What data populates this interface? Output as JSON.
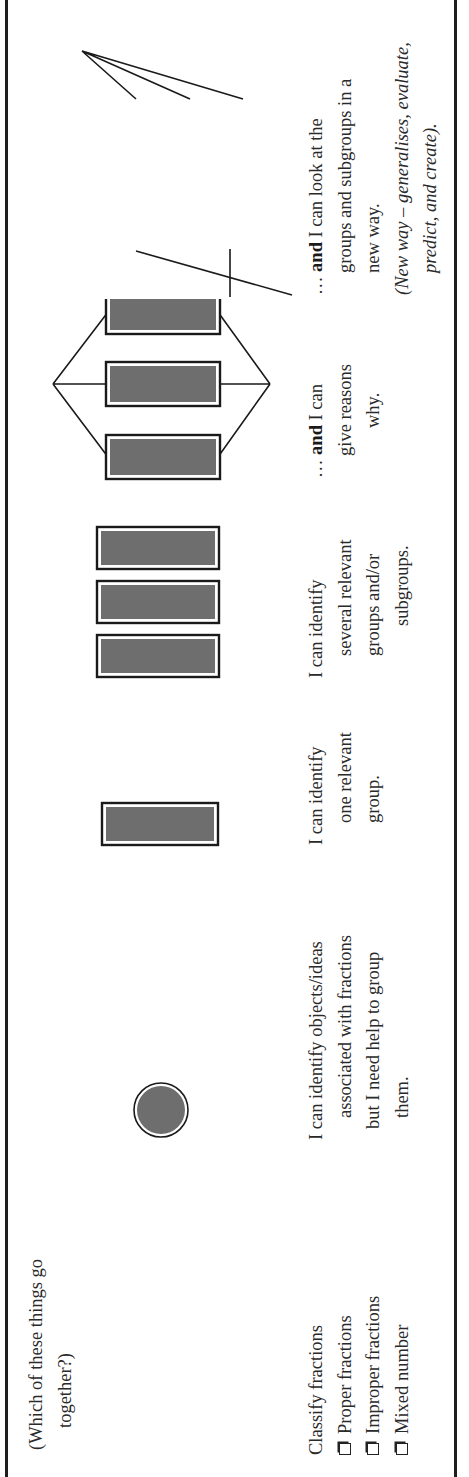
{
  "question": "(Which of these things go together?)",
  "question_lines": [
    "(Which of these things go",
    "together?)"
  ],
  "task": {
    "title": "Classify fractions",
    "checklist": [
      {
        "label": "Proper fractions",
        "checked": false
      },
      {
        "label": "Improper fractions",
        "checked": false
      },
      {
        "label": "Mixed number",
        "checked": false
      }
    ]
  },
  "levels": [
    {
      "graphic": "single-dot",
      "lines": [
        "I can identify objects/ideas",
        "associated with fractions",
        "but I need help to group",
        "them."
      ]
    },
    {
      "graphic": "one-rectangle",
      "lines": [
        "I can identify",
        "one relevant",
        "group."
      ]
    },
    {
      "graphic": "three-rectangles",
      "lines": [
        "I can identify",
        "several relevant",
        "groups and/or",
        "subgroups."
      ]
    },
    {
      "graphic": "three-rectangles-linked",
      "prefix": "… ",
      "bold": "and",
      "lines": [
        " I can",
        "give reasons",
        "why."
      ]
    },
    {
      "graphic": "three-rectangles-linked-with-loop",
      "prefix": "… ",
      "bold": "and",
      "lines": [
        " I can look at the",
        "groups and subgroups in a",
        "new way."
      ],
      "note_lines": [
        "(New way – generalises, evaluate,",
        "predict, and create)."
      ]
    }
  ],
  "colors": {
    "rule": "#1e1e1e",
    "shape_fill": "#6e6e6e",
    "shape_stroke": "#1a1a1a",
    "text": "#2a2a2a"
  }
}
